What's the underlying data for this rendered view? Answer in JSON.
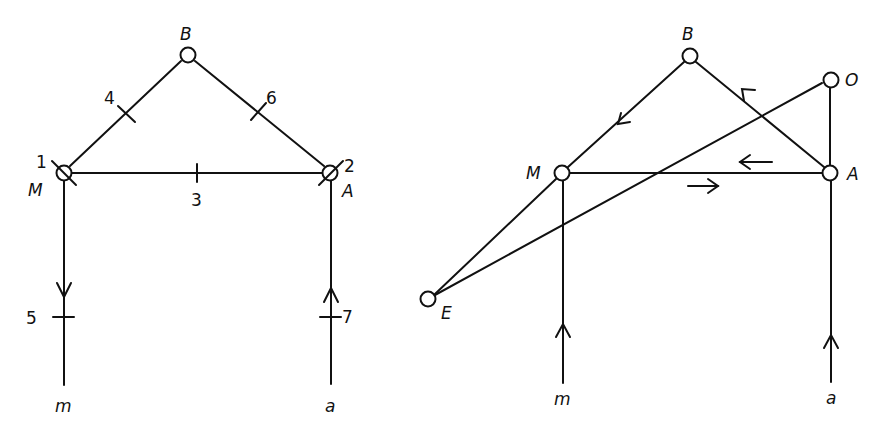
{
  "left_diagram": {
    "nodes": {
      "B": {
        "label": "B"
      },
      "M": {
        "label": "M",
        "number": "1"
      },
      "A": {
        "label": "A",
        "number": "2"
      }
    },
    "tick_labels": [
      "3",
      "4",
      "5",
      "6",
      "7"
    ],
    "terminals": {
      "m": "m",
      "a": "a"
    }
  },
  "right_diagram": {
    "nodes": {
      "B": {
        "label": "B"
      },
      "M": {
        "label": "M"
      },
      "A": {
        "label": "A"
      },
      "O": {
        "label": "O"
      },
      "E": {
        "label": "E"
      }
    },
    "terminals": {
      "m": "m",
      "a": "a"
    }
  }
}
